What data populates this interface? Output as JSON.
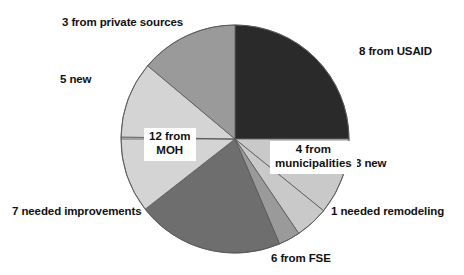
{
  "chart_data": {
    "type": "pie",
    "title": "",
    "subtitle": "",
    "xlabel": "",
    "ylabel": "",
    "legend_position": "none",
    "grid": false,
    "start_angle_deg": 0,
    "direction": "clockwise",
    "center": {
      "x": 235,
      "y": 139
    },
    "radius": 114,
    "total": 40,
    "categories": [
      "8 from USAID",
      "4 from municipalities",
      "3 new",
      "1 needed remodeling",
      "6 from FSE",
      "7 needed improvements",
      "12 from MOH",
      "5 new",
      "3 from private sources"
    ],
    "values": [
      8,
      4,
      3,
      1,
      6,
      7,
      12,
      5,
      3
    ],
    "slices": [
      {
        "label": "8 from USAID",
        "value": 8,
        "color": "#2a2a2a",
        "start_deg": 0,
        "end_deg": 90,
        "label_placement": "outside-right",
        "label_style": "plain"
      },
      {
        "label": "4 from municipalities",
        "value": 4,
        "color": "#c9c9c9",
        "start_deg": 90,
        "end_deg": 129,
        "label_placement": "boxed-overlay",
        "label_style": "boxed",
        "label_line1": "4 from",
        "label_line2": "municipalities"
      },
      {
        "label": "3 new",
        "value": 3,
        "color": "#c9c9c9",
        "start_deg": 129,
        "end_deg": 146,
        "label_placement": "outside-right",
        "label_style": "plain"
      },
      {
        "label": "1 needed remodeling",
        "value": 1,
        "color": "#9a9a9a",
        "start_deg": 146,
        "end_deg": 157,
        "label_placement": "outside-right",
        "label_style": "plain"
      },
      {
        "label": "6 from FSE",
        "value": 6,
        "color": "#6e6e6e",
        "start_deg": 157,
        "end_deg": 232,
        "label_placement": "outside-bottom",
        "label_style": "plain"
      },
      {
        "label": "7 needed improvements",
        "value": 7,
        "color": "#d4d4d4",
        "start_deg": 232,
        "end_deg": 271,
        "label_placement": "outside-left",
        "label_style": "plain"
      },
      {
        "label": "12 from MOH",
        "value": 12,
        "color": "#d4d4d4",
        "start_deg": 271,
        "end_deg": 310,
        "label_placement": "boxed-overlay",
        "label_style": "boxed",
        "label_line1": "12 from",
        "label_line2": "MOH"
      },
      {
        "label": "5 new",
        "value": 5,
        "color": "#d4d4d4",
        "start_deg": 271,
        "end_deg": 310,
        "label_placement": "outside-left",
        "label_style": "plain"
      },
      {
        "label": "3 from private sources",
        "value": 3,
        "color": "#9a9a9a",
        "start_deg": 310,
        "end_deg": 360,
        "label_placement": "outside-top",
        "label_style": "plain"
      }
    ],
    "colors": {
      "dark": "#2a2a2a",
      "mid_dark": "#6e6e6e",
      "mid": "#9a9a9a",
      "light": "#c9c9c9",
      "lighter": "#d4d4d4",
      "outline": "#555555",
      "background": "#ffffff"
    }
  },
  "labels": {
    "private_sources": "3 from private sources",
    "usaid": "8 from USAID",
    "five_new": "5 new",
    "three_new": "3 new",
    "needed_remodeling": "1 needed remodeling",
    "needed_improvements": "7 needed improvements",
    "from_fse": "6 from FSE",
    "moh_line1": "12 from",
    "moh_line2": "MOH",
    "muni_line1": "4 from",
    "muni_line2": "municipalities"
  }
}
